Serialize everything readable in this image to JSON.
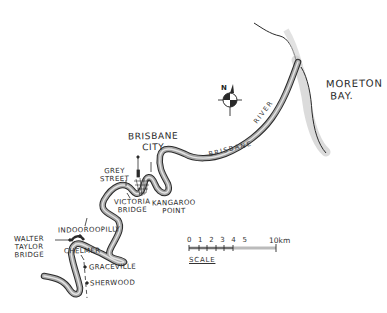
{
  "map": {
    "style": "hand-drawn pencil sketch",
    "subject": "Brisbane River",
    "colors": {
      "background": "#ffffff",
      "ink": "#2a2a2a",
      "river_fill": "#9a9a9a",
      "coast_shade": "#cccccc"
    }
  },
  "labels": {
    "moreton_bay_line1": "MORETON",
    "moreton_bay_line2": "BAY.",
    "brisbane_river": "BRISBANE",
    "river_word": "RIVER",
    "brisbane_city_line1": "BRISBANE",
    "brisbane_city_line2": "CITY",
    "grey_street_line1": "GREY",
    "grey_street_line2": "STREET",
    "victoria_bridge_line1": "VICTORIA",
    "victoria_bridge_line2": "BRIDGE",
    "kangaroo_point_line1": "KANGAROO",
    "kangaroo_point_line2": "POINT",
    "indooroopilly": "INDOOROOPILLY",
    "walter_taylor_line1": "WALTER",
    "walter_taylor_line2": "TAYLOR",
    "walter_taylor_line3": "BRIDGE",
    "chelmer": "CHELMER",
    "graceville": "GRACEVILLE",
    "sherwood": "SHERWOOD"
  },
  "compass": {
    "letter": "N",
    "icon": "north-arrow-icon"
  },
  "scale": {
    "ticks": "0 1 2 3 4 5",
    "end_label": "10km",
    "word": "SCALE"
  }
}
